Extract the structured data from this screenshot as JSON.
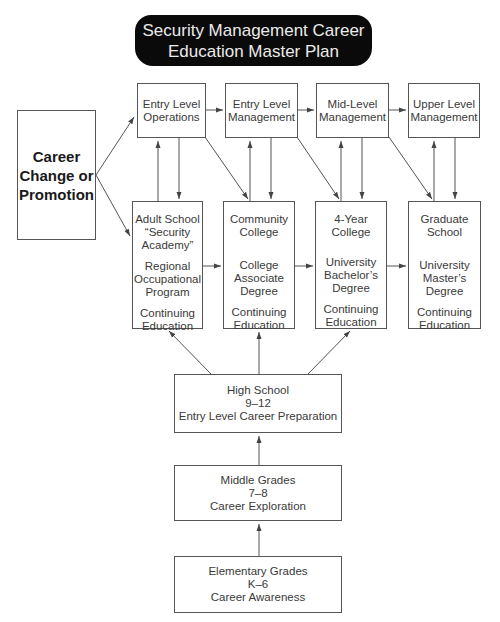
{
  "title": {
    "line1": "Security Management Career",
    "line2": "Education Master Plan"
  },
  "career_box": {
    "line1": "Career",
    "line2": "Change or",
    "line3": "Promotion"
  },
  "top_row": [
    {
      "line1": "Entry Level",
      "line2": "Operations"
    },
    {
      "line1": "Entry Level",
      "line2": "Management"
    },
    {
      "line1": "Mid-Level",
      "line2": "Management"
    },
    {
      "line1": "Upper Level",
      "line2": "Management"
    }
  ],
  "middle_row": [
    {
      "groups": [
        [
          "Adult School",
          "“Security",
          "Academy”"
        ],
        [
          "Regional",
          "Occupational",
          "Program"
        ],
        [
          "Continuing",
          "Education"
        ]
      ]
    },
    {
      "groups": [
        [
          "Community",
          "College"
        ],
        [
          "College",
          "Associate",
          "Degree"
        ],
        [
          "Continuing",
          "Education"
        ]
      ]
    },
    {
      "groups": [
        [
          "4-Year College"
        ],
        [
          "University",
          "Bachelor’s",
          "Degree"
        ],
        [
          "Continuing",
          "Education"
        ]
      ]
    },
    {
      "groups": [
        [
          "Graduate",
          "School"
        ],
        [
          "University",
          "Master’s",
          "Degree"
        ],
        [
          "Continuing",
          "Education"
        ]
      ]
    }
  ],
  "high_school": {
    "line1": "High School",
    "line2": "9–12",
    "line3": "Entry Level Career Preparation"
  },
  "middle_grades": {
    "line1": "Middle Grades",
    "line2": "7–8",
    "line3": "Career Exploration"
  },
  "elementary": {
    "line1": "Elementary Grades",
    "line2": "K–6",
    "line3": "Career Awareness"
  },
  "colors": {
    "title_bg": "#0a0a0a",
    "title_text": "#eaeaea",
    "line": "#555555"
  }
}
